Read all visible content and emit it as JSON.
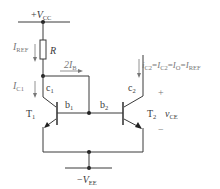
{
  "diagram": {
    "supply_top": {
      "sign": "+",
      "symbol": "V",
      "sub": "CC"
    },
    "supply_bottom": {
      "sign": "−",
      "symbol": "V",
      "sub": "EE"
    },
    "resistor": {
      "label": "R"
    },
    "currents": {
      "i_ref": {
        "symbol": "I",
        "sub": "REF"
      },
      "i_c1": {
        "symbol": "I",
        "sub": "C1"
      },
      "two_ib": {
        "prefix": "2",
        "symbol": "I",
        "sub": "B"
      },
      "output_eq": [
        {
          "symbol": "i",
          "sub": "C2"
        },
        {
          "text": "="
        },
        {
          "symbol": "I",
          "sub": "C2"
        },
        {
          "text": "="
        },
        {
          "symbol": "I",
          "sub": "O"
        },
        {
          "text": "="
        },
        {
          "symbol": "I",
          "sub": "REF"
        }
      ]
    },
    "transistors": [
      {
        "name": "T",
        "sub": "1",
        "collector": {
          "symbol": "c",
          "sub": "1"
        },
        "base": {
          "symbol": "b",
          "sub": "1"
        }
      },
      {
        "name": "T",
        "sub": "2",
        "collector": {
          "symbol": "c",
          "sub": "2"
        },
        "base": {
          "symbol": "b",
          "sub": "2"
        }
      }
    ],
    "output_voltage": {
      "plus": "+",
      "minus": "−",
      "symbol": "v",
      "sub": "CE"
    },
    "colors": {
      "wire": "#3a3a3a",
      "annotation": "#777777",
      "node": "#222222"
    }
  }
}
